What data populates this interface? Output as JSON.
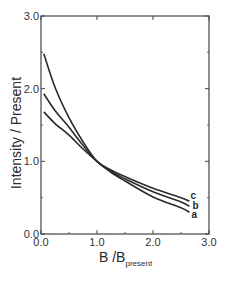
{
  "chart_data": {
    "type": "line",
    "title": "",
    "xlabel": "B /B",
    "xlabel_subscript": "present",
    "ylabel": "Intensity / Present",
    "xlim": [
      0.0,
      3.0
    ],
    "ylim": [
      0.0,
      3.0
    ],
    "x_ticks": [
      "0.0",
      "1.0",
      "2.0",
      "3.0"
    ],
    "y_ticks": [
      "0.0",
      "1.0",
      "2.0",
      "3.0"
    ],
    "grid": false,
    "legend": "inline labels at curve ends",
    "x": [
      0.05,
      0.25,
      0.5,
      0.75,
      1.0,
      1.25,
      1.5,
      2.0,
      2.5,
      2.65
    ],
    "series": [
      {
        "name": "a",
        "values": [
          1.68,
          1.52,
          1.36,
          1.17,
          1.0,
          0.85,
          0.73,
          0.51,
          0.36,
          0.3
        ]
      },
      {
        "name": "b",
        "values": [
          1.93,
          1.7,
          1.47,
          1.22,
          1.0,
          0.86,
          0.76,
          0.58,
          0.44,
          0.38
        ]
      },
      {
        "name": "c",
        "values": [
          2.48,
          2.02,
          1.6,
          1.27,
          1.0,
          0.88,
          0.79,
          0.63,
          0.5,
          0.45
        ]
      }
    ]
  }
}
